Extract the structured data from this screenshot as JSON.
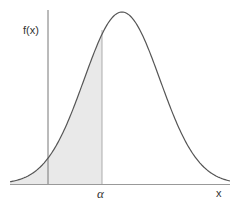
{
  "chart_data": {
    "type": "area",
    "title": "",
    "xlabel": "x",
    "ylabel": "f(x)",
    "annotations": [
      {
        "text": "α",
        "position": "x-axis tick at shaded region's right boundary"
      }
    ],
    "curve": {
      "shape": "normal",
      "peak_x_px": 122,
      "peak_y_px": 12,
      "sigma_px": 38
    },
    "shaded_region": {
      "from": "-inf",
      "to": "α",
      "color": "#e9e9e9"
    },
    "grid": false,
    "legend": null
  },
  "labels": {
    "y_axis": "f(x)",
    "x_axis": "x",
    "alpha": "α"
  },
  "colors": {
    "curve": "#555555",
    "axis": "#888888",
    "shade": "#e9e9e9"
  }
}
